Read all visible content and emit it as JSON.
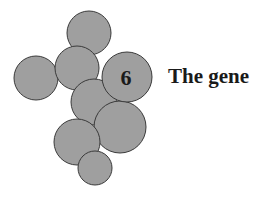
{
  "chapter": {
    "number": "6",
    "title": "The gene"
  },
  "graphic": {
    "description": "cluster of overlapping grey circles",
    "fill_color": "#9f9f9f",
    "stroke_color": "#3a3a3a"
  }
}
